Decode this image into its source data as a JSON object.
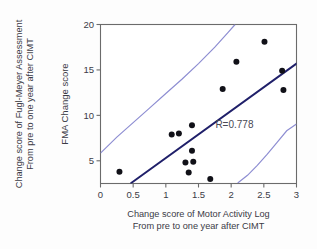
{
  "figure": {
    "name": "scatter-regression-figure",
    "background": "#fdfdfd"
  },
  "chart_data": {
    "type": "scatter",
    "title": "",
    "xlabel": "Change score of Motor Activity Log",
    "xlabel_line2": "From pre to one year after CIMT",
    "ylabel": "Change score of Fugl-Meyer Assessment",
    "ylabel_line2": "From pre to one year after CIMT",
    "ylabel_inner": "FMA Change score",
    "xlim": [
      0,
      3
    ],
    "ylim": [
      2.5,
      20
    ],
    "xticks": [
      0,
      0.5,
      1,
      1.5,
      2,
      2.5,
      3
    ],
    "xticklabels": [
      "0",
      "0.5",
      "1",
      "1.5",
      "2",
      "2.5",
      "3"
    ],
    "yticks": [
      5,
      10,
      15,
      20
    ],
    "yticklabels": [
      "5",
      "10",
      "15",
      "20"
    ],
    "grid": false,
    "legend": null,
    "annotations": [
      {
        "text": "R=0.778",
        "x": 2.05,
        "y": 8.6
      }
    ],
    "points": [
      {
        "x": 0.29,
        "y": 3.8
      },
      {
        "x": 1.09,
        "y": 7.9
      },
      {
        "x": 1.2,
        "y": 8.0
      },
      {
        "x": 1.4,
        "y": 8.9
      },
      {
        "x": 1.4,
        "y": 6.1
      },
      {
        "x": 1.3,
        "y": 4.8
      },
      {
        "x": 1.42,
        "y": 4.9
      },
      {
        "x": 1.35,
        "y": 3.7
      },
      {
        "x": 1.68,
        "y": 3.0
      },
      {
        "x": 1.87,
        "y": 12.9
      },
      {
        "x": 2.08,
        "y": 15.9
      },
      {
        "x": 2.51,
        "y": 18.1
      },
      {
        "x": 2.78,
        "y": 14.9
      },
      {
        "x": 2.8,
        "y": 12.8
      }
    ],
    "marker": {
      "shape": "circle",
      "size": 3.0,
      "color": "#111118"
    },
    "regression_line": {
      "color": "#20206a",
      "x_start": 0.47,
      "y_start": 2.55,
      "x_end": 3.0,
      "y_end": 15.7
    },
    "confidence_bands": {
      "color": "#8e8ed2",
      "upper": [
        {
          "x": 0.0,
          "y": 5.85
        },
        {
          "x": 0.25,
          "y": 7.6
        },
        {
          "x": 0.5,
          "y": 9.2
        },
        {
          "x": 0.75,
          "y": 10.8
        },
        {
          "x": 1.0,
          "y": 12.4
        },
        {
          "x": 1.25,
          "y": 14.0
        },
        {
          "x": 1.5,
          "y": 15.7
        },
        {
          "x": 1.75,
          "y": 17.5
        },
        {
          "x": 1.95,
          "y": 19.1
        },
        {
          "x": 2.06,
          "y": 20.0
        }
      ],
      "lower": [
        {
          "x": 2.1,
          "y": 2.55
        },
        {
          "x": 2.25,
          "y": 3.4
        },
        {
          "x": 2.4,
          "y": 4.5
        },
        {
          "x": 2.55,
          "y": 5.7
        },
        {
          "x": 2.7,
          "y": 7.0
        },
        {
          "x": 2.85,
          "y": 8.3
        },
        {
          "x": 3.0,
          "y": 9.05
        }
      ]
    }
  }
}
